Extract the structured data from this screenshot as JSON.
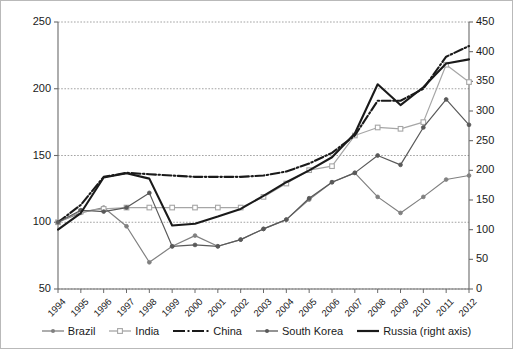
{
  "chart_data": {
    "type": "line",
    "title": "",
    "xlabel": "",
    "ylabel": "",
    "y2label": "",
    "grid": true,
    "legend_position": "bottom",
    "x": [
      "1994",
      "1995",
      "1996",
      "1997",
      "1998",
      "1999",
      "2000",
      "2001",
      "2002",
      "2003",
      "2004",
      "2005",
      "2006",
      "2007",
      "2008",
      "2009",
      "2010",
      "2011",
      "2012"
    ],
    "ylim": [
      50,
      250
    ],
    "yticks": [
      50,
      100,
      150,
      200,
      250
    ],
    "y2lim": [
      0,
      450
    ],
    "y2ticks": [
      0,
      50,
      100,
      150,
      200,
      250,
      300,
      350,
      400,
      450
    ],
    "series": [
      {
        "name": "Brazil",
        "axis": "left",
        "color": "#808080",
        "style": "solid",
        "marker": "dot",
        "values": [
          100,
          107,
          111,
          97,
          70,
          82,
          90,
          82,
          87,
          95,
          102,
          117,
          130,
          137,
          119,
          107,
          119,
          132,
          135
        ]
      },
      {
        "name": "India",
        "axis": "left",
        "color": "#a6a6a6",
        "style": "solid",
        "marker": "open-square",
        "values": [
          100,
          108,
          110,
          111,
          111,
          111,
          111,
          111,
          111,
          119,
          129,
          139,
          142,
          165,
          171,
          170,
          175,
          218,
          205
        ]
      },
      {
        "name": "China",
        "axis": "left",
        "color": "#1a1a1a",
        "style": "dash-dot",
        "marker": "none",
        "values": [
          100,
          113,
          134,
          137,
          136,
          135,
          134,
          134,
          134,
          135,
          138,
          144,
          152,
          165,
          191,
          191,
          200,
          224,
          232
        ]
      },
      {
        "name": "South Korea",
        "axis": "left",
        "color": "#595959",
        "style": "solid",
        "marker": "filled-dot",
        "values": [
          100,
          109,
          108,
          111,
          122,
          82,
          83,
          82,
          87,
          95,
          102,
          118,
          130,
          137,
          150,
          143,
          171,
          192,
          173
        ]
      },
      {
        "name": "Russia (right axis)",
        "axis": "right",
        "color": "#1a1a1a",
        "style": "solid",
        "marker": "none",
        "values": [
          100,
          128,
          188,
          195,
          186,
          107,
          110,
          122,
          135,
          157,
          180,
          200,
          222,
          262,
          345,
          310,
          340,
          380,
          387
        ]
      }
    ]
  },
  "legend": {
    "items": [
      {
        "label": "Brazil"
      },
      {
        "label": "India"
      },
      {
        "label": "China"
      },
      {
        "label": "South Korea"
      },
      {
        "label": "Russia (right axis)"
      }
    ]
  }
}
